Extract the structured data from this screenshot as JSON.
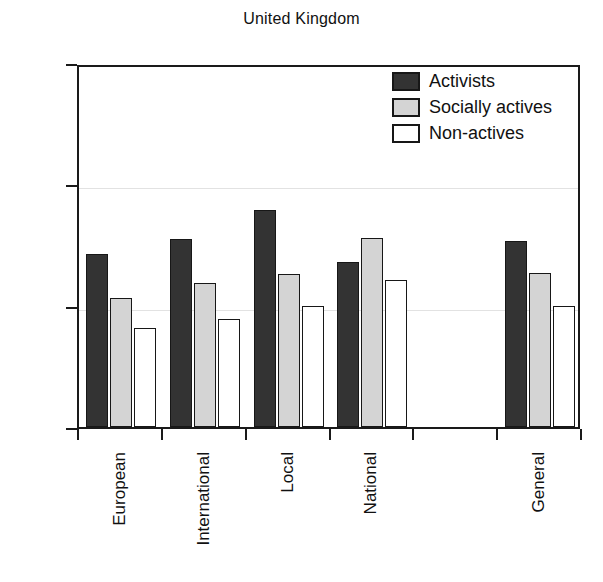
{
  "chart_data": {
    "type": "bar",
    "title": "United Kingdom",
    "xlabel": "",
    "ylabel": "",
    "ylim": [
      1.0,
      4.0
    ],
    "yticks": [
      "1.00",
      "2.00",
      "3.00",
      "4.00"
    ],
    "ytick_values": [
      1.0,
      2.0,
      3.0,
      4.0
    ],
    "grid": true,
    "legend_position": "top-right",
    "categories": [
      "European",
      "International",
      "Local",
      "National",
      "",
      "General"
    ],
    "series": [
      {
        "name": "Activists",
        "color": "#333333",
        "values": [
          2.43,
          2.55,
          2.79,
          2.36,
          null,
          2.53
        ]
      },
      {
        "name": "Socially actives",
        "color": "#d4d4d4",
        "values": [
          2.06,
          2.19,
          2.26,
          2.56,
          null,
          2.27
        ]
      },
      {
        "name": "Non-actives",
        "color": "#ffffff",
        "values": [
          1.82,
          1.89,
          2.0,
          2.21,
          null,
          2.0
        ]
      }
    ]
  },
  "legend": {
    "items": [
      {
        "label": "Activists",
        "swatch": "dark-swatch-icon"
      },
      {
        "label": "Socially actives",
        "swatch": "gray-swatch-icon"
      },
      {
        "label": "Non-actives",
        "swatch": "white-swatch-icon"
      }
    ]
  },
  "axes": {
    "y_tick_labels": [
      "4.00",
      "3.00",
      "2.00",
      "1.00"
    ],
    "x_tick_labels": [
      "European",
      "International",
      "Local",
      "National",
      "",
      "General"
    ]
  },
  "colors": {
    "series_activists": "#333333",
    "series_socially_actives": "#d4d4d4",
    "series_non_actives": "#ffffff",
    "axis": "#1a1a1a",
    "grid": "#e2e2e2",
    "text": "#111111"
  }
}
